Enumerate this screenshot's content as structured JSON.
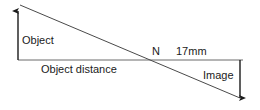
{
  "diagram": {
    "type": "optical-ray-diagram",
    "stroke_color": "#4a4a4a",
    "axis_color": "#6b6b6b",
    "arrow_color": "#1b1b1b",
    "background_color": "#ffffff",
    "labels": {
      "object": "Object",
      "object_distance": "Object distance",
      "node": "N",
      "focal_length": "17mm",
      "image": "Image"
    },
    "geometry": {
      "object_arrow": {
        "x": 18,
        "y_base": 60,
        "y_tip": 10,
        "direction": "up"
      },
      "image_arrow": {
        "x": 240,
        "y_base": 60,
        "y_tip": 99,
        "direction": "down"
      },
      "optical_axis": {
        "x1": 18,
        "y1": 60,
        "x2": 243,
        "y2": 60
      },
      "chief_ray": {
        "x1": 20,
        "y1": 5,
        "x2": 240,
        "y2": 98
      },
      "node_point": {
        "x": 152,
        "y": 60
      }
    }
  }
}
